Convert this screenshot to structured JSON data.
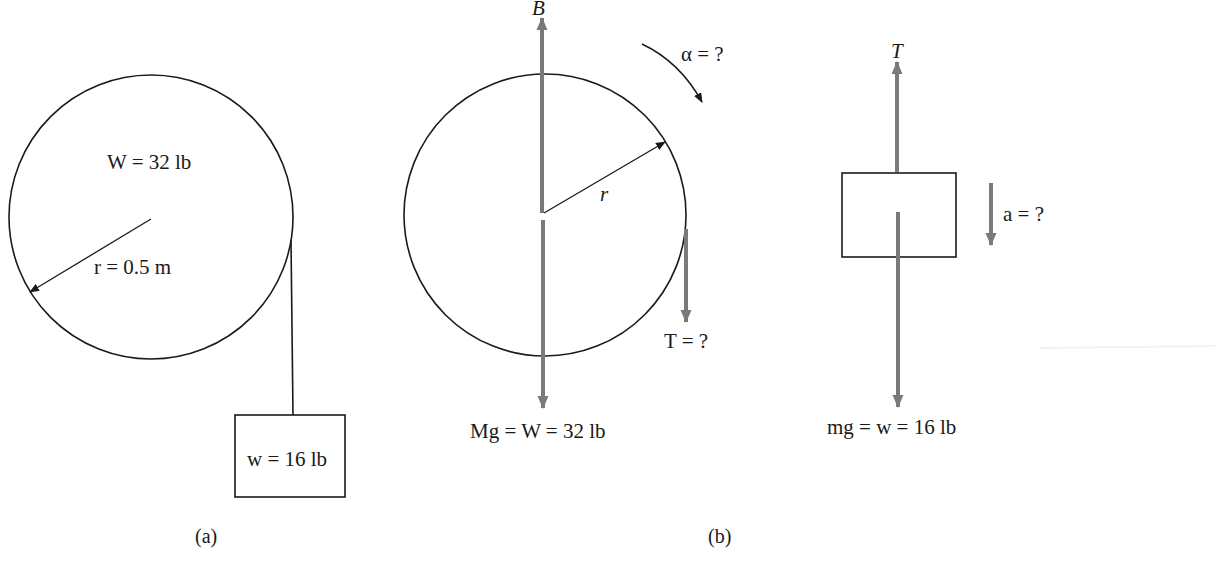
{
  "colors": {
    "line": "#1a1a1a",
    "force_arrow": "#7a7a7a",
    "background": "#ffffff"
  },
  "panel_a": {
    "caption": "(a)",
    "pulley_label": "W = 32 lb",
    "radius_label": "r = 0.5 m",
    "block_label": "w = 16 lb"
  },
  "panel_b": {
    "caption": "(b)",
    "pulley_fbd": {
      "support_force_label": "B",
      "angular_accel_label": "α = ?",
      "radius_label": "r",
      "tension_label": "T = ?",
      "weight_label": "Mg = W = 32 lb"
    },
    "block_fbd": {
      "tension_label": "T",
      "accel_label": "a = ?",
      "weight_label": "mg = w = 16 lb"
    }
  }
}
